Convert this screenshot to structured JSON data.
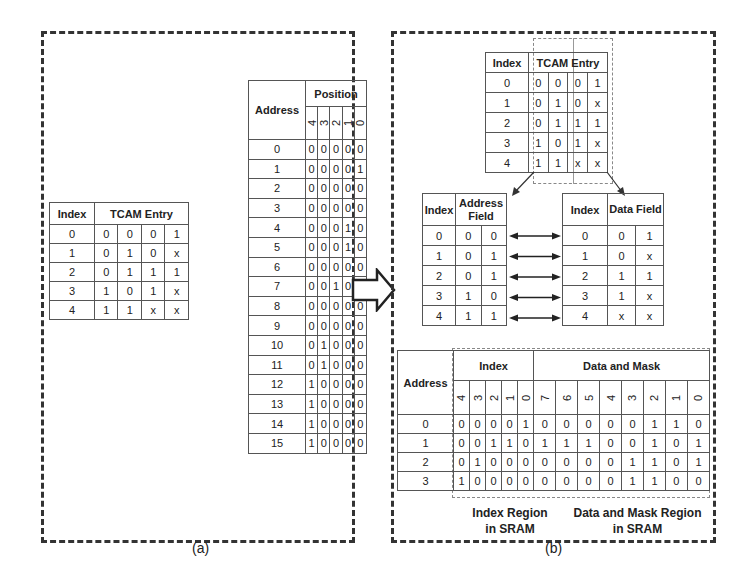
{
  "panel_a": {
    "caption": "(a)",
    "tcam_table": {
      "headers": [
        "Index",
        "TCAM Entry"
      ],
      "rows": [
        {
          "index": "0",
          "entry": [
            "0",
            "0",
            "0",
            "1"
          ]
        },
        {
          "index": "1",
          "entry": [
            "0",
            "1",
            "0",
            "x"
          ]
        },
        {
          "index": "2",
          "entry": [
            "0",
            "1",
            "1",
            "1"
          ]
        },
        {
          "index": "3",
          "entry": [
            "1",
            "0",
            "1",
            "x"
          ]
        },
        {
          "index": "4",
          "entry": [
            "1",
            "1",
            "x",
            "x"
          ]
        }
      ]
    },
    "position_table": {
      "headers": [
        "Address",
        "Position"
      ],
      "positions": [
        "4",
        "3",
        "2",
        "1",
        "0"
      ],
      "rows": [
        {
          "address": "0",
          "bits": [
            "0",
            "0",
            "0",
            "0",
            "0"
          ]
        },
        {
          "address": "1",
          "bits": [
            "0",
            "0",
            "0",
            "0",
            "1"
          ]
        },
        {
          "address": "2",
          "bits": [
            "0",
            "0",
            "0",
            "0",
            "0"
          ]
        },
        {
          "address": "3",
          "bits": [
            "0",
            "0",
            "0",
            "0",
            "0"
          ]
        },
        {
          "address": "4",
          "bits": [
            "0",
            "0",
            "0",
            "1",
            "0"
          ]
        },
        {
          "address": "5",
          "bits": [
            "0",
            "0",
            "0",
            "1",
            "0"
          ]
        },
        {
          "address": "6",
          "bits": [
            "0",
            "0",
            "0",
            "0",
            "0"
          ]
        },
        {
          "address": "7",
          "bits": [
            "0",
            "0",
            "1",
            "0",
            "0"
          ]
        },
        {
          "address": "8",
          "bits": [
            "0",
            "0",
            "0",
            "0",
            "0"
          ]
        },
        {
          "address": "9",
          "bits": [
            "0",
            "0",
            "0",
            "0",
            "0"
          ]
        },
        {
          "address": "10",
          "bits": [
            "0",
            "1",
            "0",
            "0",
            "0"
          ]
        },
        {
          "address": "11",
          "bits": [
            "0",
            "1",
            "0",
            "0",
            "0"
          ]
        },
        {
          "address": "12",
          "bits": [
            "1",
            "0",
            "0",
            "0",
            "0"
          ]
        },
        {
          "address": "13",
          "bits": [
            "1",
            "0",
            "0",
            "0",
            "0"
          ]
        },
        {
          "address": "14",
          "bits": [
            "1",
            "0",
            "0",
            "0",
            "0"
          ]
        },
        {
          "address": "15",
          "bits": [
            "1",
            "0",
            "0",
            "0",
            "0"
          ]
        }
      ]
    }
  },
  "panel_b": {
    "caption": "(b)",
    "tcam_table": {
      "headers": [
        "Index",
        "TCAM Entry"
      ],
      "rows": [
        {
          "index": "0",
          "entry": [
            "0",
            "0",
            "0",
            "1"
          ]
        },
        {
          "index": "1",
          "entry": [
            "0",
            "1",
            "0",
            "x"
          ]
        },
        {
          "index": "2",
          "entry": [
            "0",
            "1",
            "1",
            "1"
          ]
        },
        {
          "index": "3",
          "entry": [
            "1",
            "0",
            "1",
            "x"
          ]
        },
        {
          "index": "4",
          "entry": [
            "1",
            "1",
            "x",
            "x"
          ]
        }
      ]
    },
    "address_field_table": {
      "headers": [
        "Index",
        "Address Field"
      ],
      "rows": [
        {
          "index": "0",
          "field": [
            "0",
            "0"
          ]
        },
        {
          "index": "1",
          "field": [
            "0",
            "1"
          ]
        },
        {
          "index": "2",
          "field": [
            "0",
            "1"
          ]
        },
        {
          "index": "3",
          "field": [
            "1",
            "0"
          ]
        },
        {
          "index": "4",
          "field": [
            "1",
            "1"
          ]
        }
      ]
    },
    "data_field_table": {
      "headers": [
        "Index",
        "Data Field"
      ],
      "rows": [
        {
          "index": "0",
          "field": [
            "0",
            "1"
          ]
        },
        {
          "index": "1",
          "field": [
            "0",
            "x"
          ]
        },
        {
          "index": "2",
          "field": [
            "1",
            "1"
          ]
        },
        {
          "index": "3",
          "field": [
            "1",
            "x"
          ]
        },
        {
          "index": "4",
          "field": [
            "x",
            "x"
          ]
        }
      ]
    },
    "sram_table": {
      "headers": [
        "Address",
        "Index",
        "Data and Mask"
      ],
      "index_positions": [
        "4",
        "3",
        "2",
        "1",
        "0"
      ],
      "data_positions": [
        "7",
        "6",
        "5",
        "4",
        "3",
        "2",
        "1",
        "0"
      ],
      "rows": [
        {
          "address": "0",
          "index": [
            "0",
            "0",
            "0",
            "0",
            "1"
          ],
          "data": [
            "0",
            "0",
            "0",
            "0",
            "0",
            "1",
            "1",
            "0"
          ]
        },
        {
          "address": "1",
          "index": [
            "0",
            "0",
            "1",
            "1",
            "0"
          ],
          "data": [
            "1",
            "1",
            "1",
            "0",
            "0",
            "1",
            "0",
            "1"
          ]
        },
        {
          "address": "2",
          "index": [
            "0",
            "1",
            "0",
            "0",
            "0"
          ],
          "data": [
            "0",
            "0",
            "0",
            "0",
            "1",
            "1",
            "0",
            "1"
          ]
        },
        {
          "address": "3",
          "index": [
            "1",
            "0",
            "0",
            "0",
            "0"
          ],
          "data": [
            "0",
            "0",
            "0",
            "0",
            "1",
            "1",
            "0",
            "0"
          ]
        }
      ]
    },
    "labels": {
      "index_region_1": "Index Region",
      "index_region_2": "in SRAM",
      "data_region_1": "Data and Mask Region",
      "data_region_2": "in SRAM"
    }
  }
}
